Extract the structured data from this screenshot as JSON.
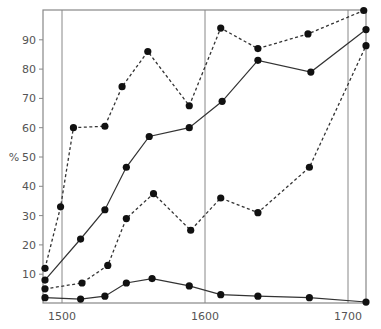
{
  "chart_data": {
    "type": "line",
    "title": "",
    "xlabel": "",
    "ylabel": "%",
    "xlim": [
      1487,
      1713
    ],
    "ylim": [
      0,
      100
    ],
    "x_ticks": [
      1500,
      1600,
      1700
    ],
    "y_ticks": [
      10,
      20,
      30,
      40,
      50,
      60,
      70,
      80,
      90
    ],
    "vertical_reference_lines": [
      1500,
      1600,
      1700
    ],
    "grid": false,
    "legend": null,
    "series": [
      {
        "name": "upper-dotted",
        "style": "dashed",
        "points": [
          [
            1488,
            12
          ],
          [
            1499,
            33
          ],
          [
            1508,
            60
          ],
          [
            1530,
            60.5
          ],
          [
            1542,
            74
          ],
          [
            1560,
            86
          ],
          [
            1589,
            67.5
          ],
          [
            1611,
            94
          ],
          [
            1637,
            87
          ],
          [
            1672,
            92
          ],
          [
            1711,
            100
          ]
        ]
      },
      {
        "name": "upper-solid",
        "style": "solid",
        "points": [
          [
            1488,
            8
          ],
          [
            1513,
            22
          ],
          [
            1530,
            32
          ],
          [
            1545,
            46.5
          ],
          [
            1561,
            57
          ],
          [
            1589,
            60
          ],
          [
            1612,
            69
          ],
          [
            1637,
            83
          ],
          [
            1674,
            79
          ],
          [
            1713,
            93.5
          ]
        ]
      },
      {
        "name": "lower-dotted",
        "style": "dashed",
        "points": [
          [
            1488,
            5
          ],
          [
            1514,
            7
          ],
          [
            1532,
            13
          ],
          [
            1545,
            29
          ],
          [
            1564,
            37.5
          ],
          [
            1590,
            25
          ],
          [
            1611,
            36
          ],
          [
            1637,
            31
          ],
          [
            1673,
            46.5
          ],
          [
            1713,
            88
          ]
        ]
      },
      {
        "name": "lower-solid",
        "style": "solid",
        "points": [
          [
            1488,
            2
          ],
          [
            1513,
            1.5
          ],
          [
            1530,
            2.5
          ],
          [
            1545,
            7
          ],
          [
            1563,
            8.5
          ],
          [
            1589,
            6
          ],
          [
            1611,
            3
          ],
          [
            1637,
            2.5
          ],
          [
            1673,
            2
          ],
          [
            1713,
            0.5
          ]
        ]
      }
    ]
  },
  "colors": {
    "axis": "#888888",
    "line": "#333333",
    "marker": "#111111",
    "text": "#555555"
  }
}
